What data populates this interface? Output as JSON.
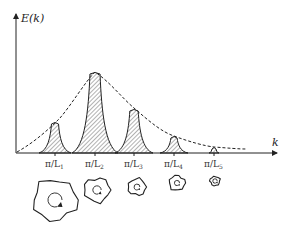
{
  "diagram": {
    "y_axis_label": "E(k)",
    "x_axis_label": "k",
    "envelope_style": "dashed",
    "peaks": [
      {
        "label": "π/L",
        "sub": "1",
        "x": 55,
        "top": 122,
        "halfwidth": 16
      },
      {
        "label": "π/L",
        "sub": "2",
        "x": 95,
        "top": 72,
        "halfwidth": 23
      },
      {
        "label": "π/L",
        "sub": "3",
        "x": 134,
        "top": 109,
        "halfwidth": 19
      },
      {
        "label": "π/L",
        "sub": "4",
        "x": 174,
        "top": 136,
        "halfwidth": 14
      },
      {
        "label": "π/L",
        "sub": "5",
        "x": 214,
        "top": 147,
        "halfwidth": 5
      }
    ],
    "eddies": [
      {
        "x": 55,
        "y": 200,
        "r": 22
      },
      {
        "x": 97,
        "y": 190,
        "r": 13
      },
      {
        "x": 137,
        "y": 187,
        "r": 9
      },
      {
        "x": 177,
        "y": 183,
        "r": 8
      },
      {
        "x": 215,
        "y": 181,
        "r": 5
      }
    ],
    "colors": {
      "ink": "#222222",
      "hatch": "#555555"
    }
  }
}
